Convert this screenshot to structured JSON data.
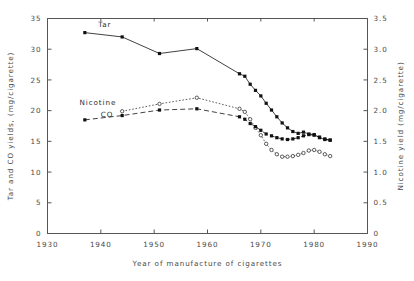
{
  "chart_data": {
    "type": "line",
    "title": "",
    "xlabel": "Year of manufacture of cigarettes",
    "ylabel_left": "Tar and CO yields, (mg/cigarette)",
    "ylabel_right": "Nicotine yield (mg/cigarette)",
    "xlim": [
      1930,
      1990
    ],
    "ylim_left": [
      0,
      35
    ],
    "ylim_right": [
      0,
      3.5
    ],
    "xticks": [
      "1930",
      "1940",
      "1950",
      "1960",
      "1970",
      "1980",
      "1990"
    ],
    "xtick_values": [
      1930,
      1940,
      1950,
      1960,
      1970,
      1980,
      1990
    ],
    "yticks_left": [
      "0",
      "5",
      "10",
      "15",
      "20",
      "25",
      "30",
      "35"
    ],
    "ytick_values_left": [
      0,
      5,
      10,
      15,
      20,
      25,
      30,
      35
    ],
    "yticks_right": [
      "0",
      "0.5",
      "1.0",
      "1.5",
      "2.0",
      "2.5",
      "3.0",
      "3.5"
    ],
    "ytick_values_right": [
      0,
      0.5,
      1.0,
      1.5,
      2.0,
      2.5,
      3.0,
      3.5
    ],
    "grid": false,
    "legend": "inline-annotations",
    "annotations": [
      {
        "text": "Tar",
        "x": 1939.5,
        "y": 33.6
      },
      {
        "text": "Nicotine",
        "x": 1936.0,
        "y": 20.9
      },
      {
        "text": "CO",
        "x": 1940.0,
        "y": 19.0
      }
    ],
    "series": [
      {
        "name": "Tar",
        "axis": "left",
        "unit": "mg/cigarette",
        "marker": "filled-square",
        "line": "solid",
        "x": [
          1937,
          1944,
          1951,
          1958,
          1966,
          1967,
          1968,
          1969,
          1970,
          1971,
          1972,
          1973,
          1974,
          1975,
          1976,
          1977,
          1978,
          1979,
          1980,
          1981,
          1982,
          1983
        ],
        "y": [
          32.7,
          32.0,
          29.3,
          30.1,
          26.0,
          25.6,
          24.3,
          23.3,
          22.4,
          21.2,
          20.1,
          19.0,
          18.0,
          17.2,
          16.6,
          16.3,
          16.5,
          16.2,
          16.1,
          15.6,
          15.3,
          15.2
        ]
      },
      {
        "name": "Nicotine",
        "axis": "right",
        "unit": "mg/cigarette",
        "marker": "open-circle",
        "line": "dotted",
        "x": [
          1944,
          1951,
          1958,
          1966,
          1967,
          1968,
          1969,
          1970,
          1971,
          1972,
          1973,
          1974,
          1975,
          1976,
          1977,
          1978,
          1979,
          1980,
          1981,
          1982,
          1983
        ],
        "y": [
          1.99,
          2.11,
          2.21,
          2.03,
          1.98,
          1.86,
          1.72,
          1.6,
          1.46,
          1.36,
          1.29,
          1.25,
          1.25,
          1.26,
          1.28,
          1.31,
          1.35,
          1.36,
          1.33,
          1.29,
          1.26
        ]
      },
      {
        "name": "CO",
        "axis": "left",
        "unit": "mg/cigarette",
        "marker": "filled-square",
        "line": "dashed",
        "x": [
          1937,
          1944,
          1951,
          1958,
          1966,
          1967,
          1968,
          1969,
          1970,
          1971,
          1972,
          1973,
          1974,
          1975,
          1976,
          1977,
          1978,
          1979,
          1980,
          1981,
          1982,
          1983
        ],
        "y": [
          18.5,
          19.2,
          20.1,
          20.3,
          19.0,
          18.6,
          17.9,
          17.4,
          16.8,
          16.2,
          15.9,
          15.6,
          15.4,
          15.3,
          15.4,
          15.6,
          15.9,
          16.1,
          16.0,
          15.7,
          15.4,
          15.2
        ]
      }
    ]
  },
  "colors": {
    "axis": "#555555",
    "series_tar": "#111111",
    "series_nicotine": "#333333",
    "series_co": "#111111",
    "background": "#ffffff"
  }
}
